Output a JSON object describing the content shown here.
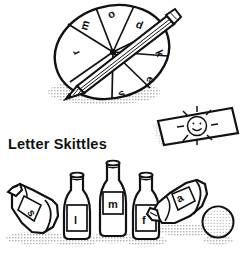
{
  "illustration": {
    "title": "Letter Skittles",
    "background_color": "#ffffff",
    "ink_color": "#111111",
    "shadow_color": "#b9b9b9"
  },
  "spinner": {
    "name": "letter-spinner-wheel",
    "segment_count": 8,
    "letters": [
      "m",
      "o",
      "d",
      "k",
      "e",
      "s",
      "f",
      "r"
    ],
    "pointer": "pencil"
  },
  "card": {
    "name": "sun-picture-card",
    "drawing": "smiling-sun"
  },
  "skittles": {
    "bottles": [
      {
        "letter": "s",
        "state": "fallen",
        "position": "left"
      },
      {
        "letter": "l",
        "state": "standing",
        "position": "left-center"
      },
      {
        "letter": "m",
        "state": "standing",
        "position": "center"
      },
      {
        "letter": "f",
        "state": "standing",
        "position": "right-center"
      },
      {
        "letter": "a",
        "state": "fallen",
        "position": "right"
      }
    ],
    "ball": "textured-ball"
  }
}
